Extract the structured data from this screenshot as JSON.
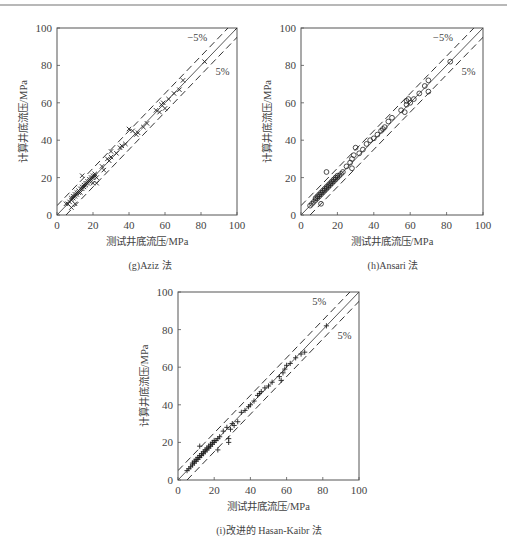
{
  "figure": {
    "panels": [
      {
        "id": "g",
        "caption": "(g)Aziz 法",
        "xlabel": "测试井底流压/MPa",
        "ylabel": "计算井底流压/MPa",
        "upper_label": "−5%",
        "lower_label": "5%",
        "marker": "x"
      },
      {
        "id": "h",
        "caption": "(h)Ansari 法",
        "xlabel": "测试井底流压/MPa",
        "ylabel": "计算井底流压/MPa",
        "upper_label": "−5%",
        "lower_label": "5%",
        "marker": "o"
      },
      {
        "id": "i",
        "caption": "(i)改进的 Hasan-Kaibr 法",
        "xlabel": "测试井底流压/MPa",
        "ylabel": "计算井底流压/MPa",
        "upper_label": "5%",
        "lower_label": "5%",
        "marker": "+"
      }
    ]
  },
  "chart_data": [
    {
      "type": "scatter",
      "title": "(g)Aziz 法",
      "xlabel": "测试井底流压/MPa",
      "ylabel": "计算井底流压/MPa",
      "xlim": [
        0,
        100
      ],
      "ylim": [
        0,
        100
      ],
      "xticks": [
        0,
        20,
        40,
        60,
        80,
        100
      ],
      "yticks": [
        0,
        20,
        40,
        60,
        80,
        100
      ],
      "grid": false,
      "reference_lines": [
        {
          "name": "y=x",
          "style": "solid"
        },
        {
          "name": "−5%",
          "style": "dashed",
          "offset": 5
        },
        {
          "name": "5%",
          "style": "dashed",
          "offset": -5
        }
      ],
      "annotations": [
        "−5%",
        "5%"
      ],
      "series": [
        {
          "name": "Aziz",
          "marker": "x",
          "points": [
            [
              5,
              6
            ],
            [
              6,
              6
            ],
            [
              7,
              7
            ],
            [
              8,
              8
            ],
            [
              8,
              9
            ],
            [
              9,
              9
            ],
            [
              9,
              10
            ],
            [
              10,
              10
            ],
            [
              10,
              11
            ],
            [
              11,
              11
            ],
            [
              11,
              12
            ],
            [
              12,
              12
            ],
            [
              12,
              13
            ],
            [
              13,
              12
            ],
            [
              13,
              14
            ],
            [
              14,
              14
            ],
            [
              14,
              15
            ],
            [
              15,
              15
            ],
            [
              15,
              16
            ],
            [
              16,
              16
            ],
            [
              16,
              17
            ],
            [
              17,
              17
            ],
            [
              17,
              18
            ],
            [
              18,
              18
            ],
            [
              18,
              19
            ],
            [
              19,
              19
            ],
            [
              19,
              20
            ],
            [
              20,
              20
            ],
            [
              20,
              21
            ],
            [
              21,
              21
            ],
            [
              21,
              22
            ],
            [
              22,
              20
            ],
            [
              14,
              21
            ],
            [
              20,
              17
            ],
            [
              22,
              17
            ],
            [
              8,
              4
            ],
            [
              10,
              6
            ],
            [
              25,
              26
            ],
            [
              26,
              24
            ],
            [
              28,
              30
            ],
            [
              29,
              29
            ],
            [
              30,
              31
            ],
            [
              30,
              34
            ],
            [
              33,
              33
            ],
            [
              35,
              36
            ],
            [
              36,
              37
            ],
            [
              38,
              38
            ],
            [
              40,
              46
            ],
            [
              42,
              45
            ],
            [
              44,
              43
            ],
            [
              45,
              44
            ],
            [
              48,
              47
            ],
            [
              50,
              49
            ],
            [
              55,
              56
            ],
            [
              57,
              55
            ],
            [
              58,
              59
            ],
            [
              59,
              60
            ],
            [
              60,
              57
            ],
            [
              62,
              62
            ],
            [
              65,
              65
            ],
            [
              68,
              67
            ],
            [
              70,
              72
            ],
            [
              82,
              82
            ],
            [
              100,
              100
            ]
          ]
        }
      ]
    },
    {
      "type": "scatter",
      "title": "(h)Ansari 法",
      "xlabel": "测试井底流压/MPa",
      "ylabel": "计算井底流压/MPa",
      "xlim": [
        0,
        100
      ],
      "ylim": [
        0,
        100
      ],
      "xticks": [
        0,
        20,
        40,
        60,
        80,
        100
      ],
      "yticks": [
        0,
        20,
        40,
        60,
        80,
        100
      ],
      "grid": false,
      "reference_lines": [
        {
          "name": "y=x",
          "style": "solid"
        },
        {
          "name": "−5%",
          "style": "dashed",
          "offset": 5
        },
        {
          "name": "5%",
          "style": "dashed",
          "offset": -5
        }
      ],
      "annotations": [
        "−5%",
        "5%"
      ],
      "series": [
        {
          "name": "Ansari",
          "marker": "o",
          "points": [
            [
              5,
              5
            ],
            [
              6,
              6
            ],
            [
              7,
              7
            ],
            [
              8,
              8
            ],
            [
              8,
              9
            ],
            [
              9,
              9
            ],
            [
              9,
              10
            ],
            [
              10,
              10
            ],
            [
              10,
              11
            ],
            [
              11,
              11
            ],
            [
              11,
              12
            ],
            [
              12,
              12
            ],
            [
              12,
              13
            ],
            [
              13,
              13
            ],
            [
              13,
              14
            ],
            [
              14,
              14
            ],
            [
              14,
              15
            ],
            [
              15,
              15
            ],
            [
              15,
              16
            ],
            [
              16,
              16
            ],
            [
              16,
              17
            ],
            [
              17,
              17
            ],
            [
              17,
              18
            ],
            [
              18,
              18
            ],
            [
              18,
              19
            ],
            [
              19,
              19
            ],
            [
              19,
              20
            ],
            [
              20,
              20
            ],
            [
              20,
              21
            ],
            [
              21,
              21
            ],
            [
              22,
              22
            ],
            [
              14,
              23
            ],
            [
              11,
              6
            ],
            [
              23,
              23
            ],
            [
              25,
              26
            ],
            [
              27,
              28
            ],
            [
              28,
              25
            ],
            [
              28,
              30
            ],
            [
              29,
              32
            ],
            [
              30,
              36
            ],
            [
              32,
              33
            ],
            [
              34,
              35
            ],
            [
              36,
              38
            ],
            [
              38,
              40
            ],
            [
              40,
              41
            ],
            [
              42,
              43
            ],
            [
              44,
              45
            ],
            [
              45,
              46
            ],
            [
              46,
              47
            ],
            [
              48,
              50
            ],
            [
              50,
              52
            ],
            [
              55,
              56
            ],
            [
              57,
              55
            ],
            [
              58,
              59
            ],
            [
              58,
              61
            ],
            [
              59,
              62
            ],
            [
              60,
              60
            ],
            [
              62,
              62
            ],
            [
              65,
              65
            ],
            [
              68,
              69
            ],
            [
              70,
              66
            ],
            [
              70,
              72
            ],
            [
              82,
              82
            ]
          ]
        }
      ]
    },
    {
      "type": "scatter",
      "title": "(i)改进的 Hasan-Kaibr 法",
      "xlabel": "测试井底流压/MPa",
      "ylabel": "计算井底流压/MPa",
      "xlim": [
        0,
        100
      ],
      "ylim": [
        0,
        100
      ],
      "xticks": [
        0,
        20,
        40,
        60,
        80,
        100
      ],
      "yticks": [
        0,
        20,
        40,
        60,
        80,
        100
      ],
      "grid": false,
      "reference_lines": [
        {
          "name": "y=x",
          "style": "solid"
        },
        {
          "name": "5%",
          "style": "dashed",
          "offset": 5
        },
        {
          "name": "5%",
          "style": "dashed",
          "offset": -5
        }
      ],
      "annotations": [
        "5%",
        "5%"
      ],
      "series": [
        {
          "name": "Improved Hasan-Kaibr",
          "marker": "+",
          "points": [
            [
              5,
              5
            ],
            [
              6,
              6
            ],
            [
              7,
              7
            ],
            [
              8,
              8
            ],
            [
              8,
              9
            ],
            [
              9,
              9
            ],
            [
              9,
              10
            ],
            [
              10,
              10
            ],
            [
              10,
              11
            ],
            [
              11,
              11
            ],
            [
              11,
              12
            ],
            [
              12,
              12
            ],
            [
              12,
              13
            ],
            [
              13,
              13
            ],
            [
              13,
              14
            ],
            [
              14,
              14
            ],
            [
              14,
              15
            ],
            [
              15,
              15
            ],
            [
              15,
              16
            ],
            [
              16,
              16
            ],
            [
              16,
              17
            ],
            [
              17,
              17
            ],
            [
              17,
              18
            ],
            [
              18,
              18
            ],
            [
              18,
              19
            ],
            [
              19,
              19
            ],
            [
              19,
              20
            ],
            [
              20,
              20
            ],
            [
              20,
              21
            ],
            [
              21,
              21
            ],
            [
              22,
              22
            ],
            [
              12,
              18
            ],
            [
              22,
              16
            ],
            [
              23,
              23
            ],
            [
              25,
              26
            ],
            [
              27,
              28
            ],
            [
              28,
              22
            ],
            [
              28,
              20
            ],
            [
              29,
              27
            ],
            [
              30,
              30
            ],
            [
              31,
              29
            ],
            [
              33,
              31
            ],
            [
              35,
              36
            ],
            [
              37,
              37
            ],
            [
              39,
              39
            ],
            [
              40,
              40
            ],
            [
              42,
              42
            ],
            [
              44,
              45
            ],
            [
              45,
              46
            ],
            [
              46,
              47
            ],
            [
              48,
              49
            ],
            [
              50,
              50
            ],
            [
              52,
              52
            ],
            [
              56,
              55
            ],
            [
              57,
              53
            ],
            [
              58,
              57
            ],
            [
              59,
              59
            ],
            [
              60,
              61
            ],
            [
              62,
              62
            ],
            [
              65,
              65
            ],
            [
              68,
              67
            ],
            [
              70,
              68
            ],
            [
              82,
              82
            ]
          ]
        }
      ]
    }
  ]
}
